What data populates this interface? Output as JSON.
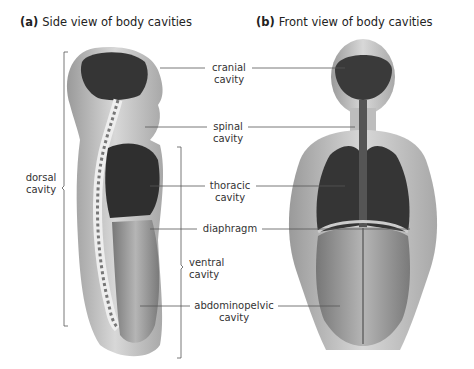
{
  "titles": {
    "a": {
      "letter": "(a)",
      "text": "Side view of body cavities"
    },
    "b": {
      "letter": "(b)",
      "text": "Front view of body cavities"
    }
  },
  "labels": {
    "cranial": {
      "line1": "cranial",
      "line2": "cavity"
    },
    "spinal": {
      "line1": "spinal",
      "line2": "cavity"
    },
    "thoracic": {
      "line1": "thoracic",
      "line2": "cavity"
    },
    "diaphragm": {
      "line1": "diaphragm"
    },
    "ventral": {
      "line1": "ventral",
      "line2": "cavity"
    },
    "abdominopelvic": {
      "line1": "abdominopelvic",
      "line2": "cavity"
    },
    "dorsal": {
      "line1": "dorsal",
      "line2": "cavity"
    }
  },
  "colors": {
    "skin": "#cfcfcf",
    "cavity_dark": "#3a3a3a",
    "cavity_mid": "#8a8a8a",
    "spine": "#e8e8e8",
    "line": "#555555"
  }
}
